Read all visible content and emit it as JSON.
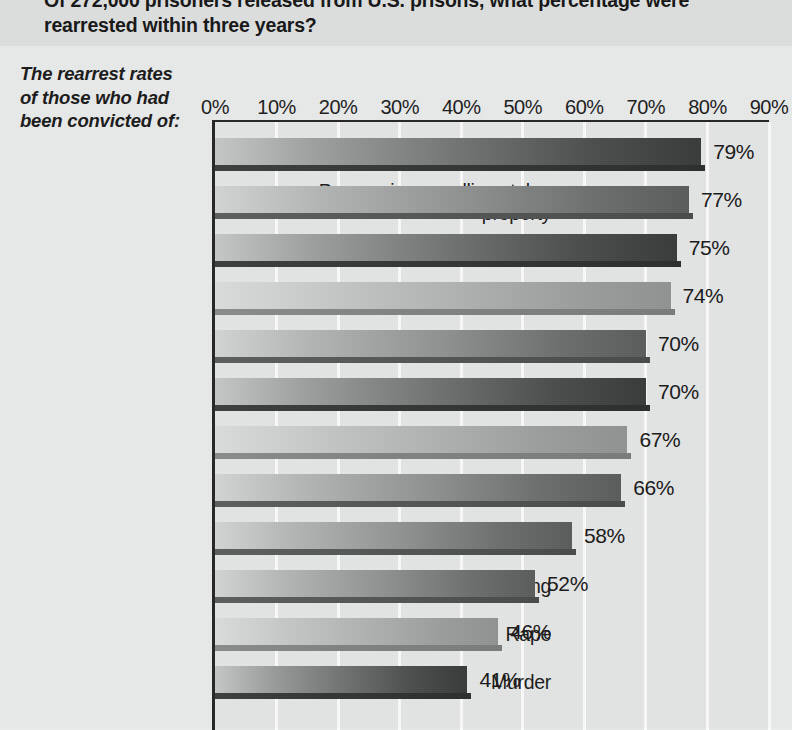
{
  "title": {
    "line1": "Of 272,000 prisoners released from U.S. prisons, what percentage were",
    "line2": "rearrested within three years?"
  },
  "caption": {
    "line1": "The rearrest rates",
    "line2": "of those who had",
    "line3": "been convicted of:"
  },
  "chart_data": {
    "type": "bar",
    "orientation": "horizontal",
    "title": "Of 272,000 prisoners released from U.S. prisons, what percentage were rearrested within three years?",
    "subtitle": "The rearrest rates of those who had been convicted of:",
    "xlabel": "",
    "ylabel": "",
    "xlim": [
      0,
      90
    ],
    "grid": true,
    "legend": false,
    "unit": "%",
    "tick_labels": [
      "0%",
      "10%",
      "20%",
      "30%",
      "40%",
      "50%",
      "60%",
      "70%",
      "80%",
      "90%"
    ],
    "ticks": [
      0,
      10,
      20,
      30,
      40,
      50,
      60,
      70,
      80,
      90
    ],
    "categories": [
      "Stealing cars",
      "Possessing or selling stolen property",
      "Larceny",
      "Burglary",
      "Robbery",
      "Illegal weapons",
      "Illegal drugs",
      "Fraud",
      "Arson",
      "Drunk driving",
      "Rape",
      "Murder"
    ],
    "values": [
      79,
      77,
      75,
      74,
      70,
      70,
      67,
      66,
      58,
      52,
      46,
      41
    ],
    "value_labels": [
      "79%",
      "77%",
      "75%",
      "74%",
      "70%",
      "70%",
      "67%",
      "66%",
      "58%",
      "52%",
      "46%",
      "41%"
    ],
    "bar_shades": [
      "dark",
      "mid",
      "dark",
      "light",
      "mid",
      "dark",
      "light",
      "mid",
      "mid",
      "mid",
      "light",
      "dark"
    ]
  },
  "colors": {
    "page_background": "#e9eaea",
    "title_band": "#dedfdf",
    "plot_background": "#e4e5e5",
    "gridline": "#fbfbfb",
    "axis": "#262626",
    "text": "#1b1b1b"
  }
}
